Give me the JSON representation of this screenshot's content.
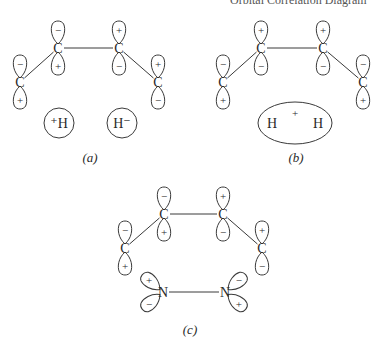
{
  "header": {
    "cutoff_text": "Orbital Correlation Diagram"
  },
  "panels": [
    {
      "id": "a",
      "caption": "(a)",
      "caption_pos": [
        90,
        162
      ],
      "atoms": [
        {
          "label": "C",
          "x": 20,
          "y": 82,
          "lobes": [
            {
              "angle": -90,
              "sign": "−"
            },
            {
              "angle": 90,
              "sign": "+"
            }
          ]
        },
        {
          "label": "C",
          "x": 58,
          "y": 48,
          "lobes": [
            {
              "angle": -90,
              "sign": "−"
            },
            {
              "angle": 90,
              "sign": "+"
            }
          ]
        },
        {
          "label": "C",
          "x": 119,
          "y": 48,
          "lobes": [
            {
              "angle": -90,
              "sign": "+"
            },
            {
              "angle": 90,
              "sign": "−"
            }
          ]
        },
        {
          "label": "C",
          "x": 158,
          "y": 82,
          "lobes": [
            {
              "angle": -90,
              "sign": "+"
            },
            {
              "angle": 90,
              "sign": "−"
            }
          ]
        }
      ],
      "bonds": [
        [
          0,
          1
        ],
        [
          1,
          2
        ],
        [
          2,
          3
        ]
      ],
      "hydrogens": {
        "type": "separate",
        "items": [
          {
            "label": "⁺H",
            "x": 59,
            "y": 123,
            "r": 15
          },
          {
            "label": "H⁻",
            "x": 122,
            "y": 123,
            "r": 15
          }
        ]
      }
    },
    {
      "id": "b",
      "caption": "(b)",
      "caption_pos": [
        296,
        162
      ],
      "atoms": [
        {
          "label": "C",
          "x": 223,
          "y": 82,
          "lobes": [
            {
              "angle": -90,
              "sign": "−"
            },
            {
              "angle": 90,
              "sign": "+"
            }
          ]
        },
        {
          "label": "C",
          "x": 261,
          "y": 48,
          "lobes": [
            {
              "angle": -90,
              "sign": "+"
            },
            {
              "angle": 90,
              "sign": "−"
            }
          ]
        },
        {
          "label": "C",
          "x": 323,
          "y": 48,
          "lobes": [
            {
              "angle": -90,
              "sign": "+"
            },
            {
              "angle": 90,
              "sign": "−"
            }
          ]
        },
        {
          "label": "C",
          "x": 363,
          "y": 82,
          "lobes": [
            {
              "angle": -90,
              "sign": "−"
            },
            {
              "angle": 90,
              "sign": "+"
            }
          ]
        }
      ],
      "bonds": [
        [
          0,
          1
        ],
        [
          1,
          2
        ],
        [
          2,
          3
        ]
      ],
      "hydrogens": {
        "type": "ellipse",
        "cx": 295,
        "cy": 123,
        "rx": 37,
        "ry": 21,
        "items": [
          {
            "label": "H",
            "x": 272,
            "y": 128
          },
          {
            "label": "+",
            "x": 295,
            "y": 117
          },
          {
            "label": "H",
            "x": 318,
            "y": 128
          }
        ]
      }
    },
    {
      "id": "c",
      "caption": "(c)",
      "caption_pos": [
        190,
        334
      ],
      "atoms": [
        {
          "label": "C",
          "x": 125,
          "y": 248,
          "lobes": [
            {
              "angle": -90,
              "sign": "−"
            },
            {
              "angle": 90,
              "sign": "+"
            }
          ]
        },
        {
          "label": "C",
          "x": 164,
          "y": 214,
          "lobes": [
            {
              "angle": -90,
              "sign": "−"
            },
            {
              "angle": 90,
              "sign": "+"
            }
          ]
        },
        {
          "label": "C",
          "x": 223,
          "y": 214,
          "lobes": [
            {
              "angle": -90,
              "sign": "+"
            },
            {
              "angle": 90,
              "sign": "−"
            }
          ]
        },
        {
          "label": "C",
          "x": 262,
          "y": 248,
          "lobes": [
            {
              "angle": -90,
              "sign": "+"
            },
            {
              "angle": 90,
              "sign": "−"
            }
          ]
        },
        {
          "label": "N",
          "x": 163,
          "y": 292,
          "lobes": [
            {
              "angle": -140,
              "sign": "+"
            },
            {
              "angle": 140,
              "sign": "−"
            }
          ]
        },
        {
          "label": "N",
          "x": 225,
          "y": 292,
          "lobes": [
            {
              "angle": -40,
              "sign": "−"
            },
            {
              "angle": 40,
              "sign": "+"
            }
          ]
        }
      ],
      "bonds": [
        [
          0,
          1
        ],
        [
          1,
          2
        ],
        [
          2,
          3
        ],
        [
          4,
          5
        ]
      ],
      "hydrogens": null
    }
  ]
}
